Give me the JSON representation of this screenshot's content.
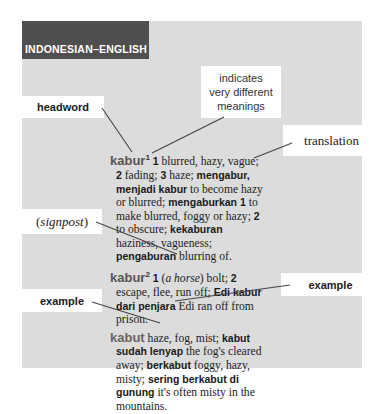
{
  "header": {
    "title": "INDONESIAN–ENGLISH"
  },
  "callouts": {
    "headword": "headword",
    "indicates": [
      "indicates",
      "very different",
      "meanings"
    ],
    "translation": "translation",
    "signpost": {
      "open": "(",
      "word": "signpost",
      "close": ")"
    },
    "example_left": "example",
    "example_right": "example"
  },
  "entries": [
    {
      "headword": "kabur",
      "sup": "1",
      "parts": [
        {
          "t": "b",
          "v": "1"
        },
        {
          "t": "n",
          "v": " blurred, hazy, vague; "
        },
        {
          "t": "b",
          "v": "2"
        },
        {
          "t": "n",
          "v": " fading; "
        },
        {
          "t": "b",
          "v": "3"
        },
        {
          "t": "n",
          "v": " haze; "
        },
        {
          "t": "b",
          "v": "mengabur, menjadi kabur"
        },
        {
          "t": "n",
          "v": " to become hazy or blurred; "
        },
        {
          "t": "b",
          "v": "mengaburkan 1"
        },
        {
          "t": "n",
          "v": " to make blurred, foggy or hazy; "
        },
        {
          "t": "b",
          "v": "2"
        },
        {
          "t": "n",
          "v": " to obscure; "
        },
        {
          "t": "b",
          "v": "kekaburan"
        },
        {
          "t": "n",
          "v": " haziness, vagueness; "
        },
        {
          "t": "b",
          "v": "pengaburan"
        },
        {
          "t": "n",
          "v": " blurring of."
        }
      ]
    },
    {
      "headword": "kabur",
      "sup": "2",
      "parts": [
        {
          "t": "b",
          "v": "1"
        },
        {
          "t": "n",
          "v": " ("
        },
        {
          "t": "i",
          "v": "a horse"
        },
        {
          "t": "n",
          "v": ") bolt; "
        },
        {
          "t": "b",
          "v": "2"
        },
        {
          "t": "n",
          "v": " escape, flee, run off; "
        },
        {
          "t": "b",
          "v": "Edi kabur dari penjara"
        },
        {
          "t": "n",
          "v": " Edi ran off from prison."
        }
      ]
    },
    {
      "headword": "kabut",
      "sup": "",
      "parts": [
        {
          "t": "n",
          "v": " haze, fog, mist; "
        },
        {
          "t": "b",
          "v": "kabut sudah lenyap"
        },
        {
          "t": "n",
          "v": " the fog's cleared away; "
        },
        {
          "t": "b",
          "v": "berkabut"
        },
        {
          "t": "n",
          "v": " foggy, hazy, misty; "
        },
        {
          "t": "b",
          "v": "sering berkabut di gunung"
        },
        {
          "t": "n",
          "v": " it's often misty in the mountains."
        }
      ]
    }
  ],
  "colors": {
    "panel": "#dcdcdc",
    "header": "#4f4f4f",
    "callout_bg": "#ffffff",
    "pointer": "#444444"
  }
}
